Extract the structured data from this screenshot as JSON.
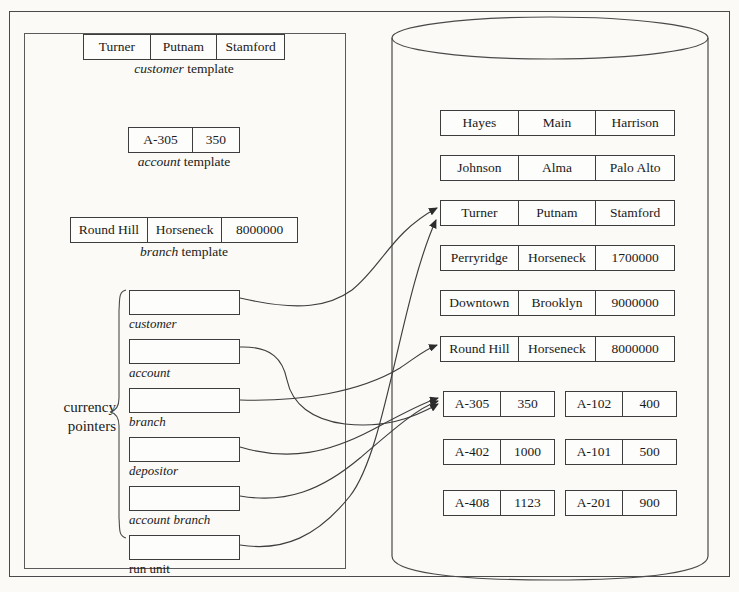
{
  "figure": {
    "background_color": "#fbfaf7",
    "line_color": "#3d3d3d"
  },
  "left_panel": {
    "templates": [
      {
        "name": "customer-template",
        "cells": [
          "Turner",
          "Putnam",
          "Stamford"
        ],
        "caption_italic": "customer",
        "caption_rest": " template"
      },
      {
        "name": "account-template",
        "cells": [
          "A-305",
          "350"
        ],
        "caption_italic": "account",
        "caption_rest": " template"
      },
      {
        "name": "branch-template",
        "cells": [
          "Round Hill",
          "Horseneck",
          "8000000"
        ],
        "caption_italic": "branch",
        "caption_rest": " template"
      }
    ],
    "currency_pointers": {
      "group_label_line1": "currency",
      "group_label_line2": "pointers",
      "items": [
        {
          "label": "customer",
          "italic": true
        },
        {
          "label": "account",
          "italic": true
        },
        {
          "label": "branch",
          "italic": true
        },
        {
          "label": "depositor",
          "italic": true
        },
        {
          "label": "account branch",
          "italic": true
        },
        {
          "label": "run unit",
          "italic": false
        }
      ]
    }
  },
  "database": {
    "shape": "cylinder",
    "records": [
      {
        "name": "customer-record-hayes",
        "cells": [
          "Hayes",
          "Main",
          "Harrison"
        ],
        "columns": 3
      },
      {
        "name": "customer-record-johnson",
        "cells": [
          "Johnson",
          "Alma",
          "Palo Alto"
        ],
        "columns": 3
      },
      {
        "name": "customer-record-turner",
        "cells": [
          "Turner",
          "Putnam",
          "Stamford"
        ],
        "columns": 3
      },
      {
        "name": "branch-record-perryridge",
        "cells": [
          "Perryridge",
          "Horseneck",
          "1700000"
        ],
        "columns": 3
      },
      {
        "name": "branch-record-downtown",
        "cells": [
          "Downtown",
          "Brooklyn",
          "9000000"
        ],
        "columns": 3
      },
      {
        "name": "branch-record-round-hill",
        "cells": [
          "Round Hill",
          "Horseneck",
          "8000000"
        ],
        "columns": 3
      }
    ],
    "account_records_left": [
      {
        "name": "account-record-a305",
        "cells": [
          "A-305",
          "350"
        ]
      },
      {
        "name": "account-record-a402",
        "cells": [
          "A-402",
          "1000"
        ]
      },
      {
        "name": "account-record-a408",
        "cells": [
          "A-408",
          "1123"
        ]
      }
    ],
    "account_records_right": [
      {
        "name": "account-record-a102",
        "cells": [
          "A-102",
          "400"
        ]
      },
      {
        "name": "account-record-a101",
        "cells": [
          "A-101",
          "500"
        ]
      },
      {
        "name": "account-record-a201",
        "cells": [
          "A-201",
          "900"
        ]
      }
    ]
  },
  "pointer_arrows": [
    {
      "from": "customer",
      "to": "customer-record-turner"
    },
    {
      "from": "account",
      "to": "account-record-a305"
    },
    {
      "from": "branch",
      "to": "branch-record-round-hill"
    },
    {
      "from": "depositor",
      "to": "account-record-a305"
    },
    {
      "from": "account branch",
      "to": "account-record-a305"
    },
    {
      "from": "run unit",
      "to": "customer-record-turner"
    }
  ]
}
